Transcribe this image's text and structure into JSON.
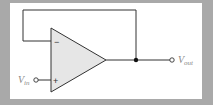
{
  "diagram": {
    "type": "voltage-follower op-amp circuit",
    "component": "operational amplifier",
    "inputs": {
      "inverting": {
        "symbol": "−"
      },
      "non_inverting": {
        "symbol": "+"
      }
    },
    "labels": {
      "input": {
        "main": "V",
        "sub": "in"
      },
      "output": {
        "main": "V",
        "sub": "out"
      }
    },
    "colors": {
      "background": "#a9a9a9",
      "panel": "#ffffff",
      "triangle_fill": "#e6e6e6",
      "wire": "#333333",
      "label": "#888888"
    }
  }
}
